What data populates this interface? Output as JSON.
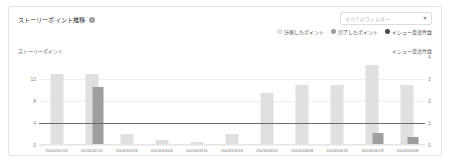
{
  "card": {
    "title": "ストーリーポイント推移",
    "info_icon": "i"
  },
  "filter": {
    "placeholder": "すべてのフィルター",
    "chevron_icon": "chevron-down-icon"
  },
  "legend": {
    "items": [
      {
        "label": "計画したポイント",
        "color": "#e0e0e0",
        "shape": "square"
      },
      {
        "label": "完了したポイント",
        "color": "#9e9e9e",
        "shape": "circle"
      },
      {
        "label": "イシュー受渡件数",
        "color": "#4a4a4a",
        "shape": "circle"
      }
    ]
  },
  "axes": {
    "left_caption": "ストーリーポイント",
    "right_caption": "イシュー受渡件数"
  },
  "chart_data": {
    "type": "bar",
    "title": "ストーリーポイント推移",
    "xlabel": "",
    "ylabel": "ストーリーポイント",
    "y2label": "イシュー受渡件数",
    "ylim": [
      0,
      16
    ],
    "y2lim": [
      0,
      4
    ],
    "yticks": [
      0,
      4,
      8,
      12
    ],
    "y2ticks": [
      0,
      1,
      2,
      3,
      4
    ],
    "grid": true,
    "legend_position": "top-right",
    "categories": [
      "2024/02/13",
      "2024/02/16",
      "2024/02/26",
      "2024/03/04",
      "2024/03/11",
      "2024/03/18",
      "2024/04/01",
      "2024/04/08",
      "2024/04/15",
      "2024/04/19",
      "2024/05/08"
    ],
    "series": [
      {
        "name": "計画したポイント",
        "color": "#e0e0e0",
        "values": [
          13,
          13,
          2,
          1,
          0.6,
          2,
          9.5,
          11,
          11,
          14.5,
          11
        ]
      },
      {
        "name": "完了したポイント",
        "color": "#9e9e9e",
        "values": [
          0,
          10.5,
          0,
          0,
          0,
          0,
          0,
          0,
          0,
          2.2,
          1.4
        ]
      }
    ],
    "line_series": {
      "name": "イシュー受渡件数",
      "color": "#6b6b6b",
      "values": [
        1,
        1,
        1,
        1,
        1,
        1,
        1,
        1,
        1,
        1,
        1
      ],
      "axis": "right"
    }
  }
}
